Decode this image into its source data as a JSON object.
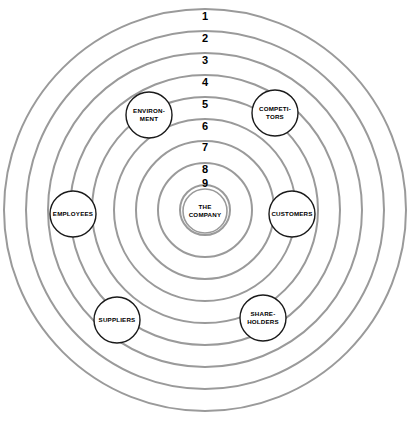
{
  "diagram": {
    "type": "concentric-circles-stakeholder-map",
    "background_color": "#ffffff",
    "ring_stroke_color": "#9a9a9a",
    "node_stroke_color": "#1a1a1a",
    "node_fill_color": "#ffffff",
    "center": {
      "cx": 205,
      "cy": 210
    },
    "rings": [
      {
        "label": "1",
        "radius": 201,
        "label_x": 205,
        "label_y": 17
      },
      {
        "label": "2",
        "radius": 179,
        "label_x": 205,
        "label_y": 39
      },
      {
        "label": "3",
        "radius": 157,
        "label_x": 205,
        "label_y": 61
      },
      {
        "label": "4",
        "radius": 135,
        "label_x": 205,
        "label_y": 83
      },
      {
        "label": "5",
        "radius": 113,
        "label_x": 205,
        "label_y": 105
      },
      {
        "label": "6",
        "radius": 91,
        "label_x": 205,
        "label_y": 127
      },
      {
        "label": "7",
        "radius": 69,
        "label_x": 205,
        "label_y": 148
      },
      {
        "label": "8",
        "radius": 47,
        "label_x": 205,
        "label_y": 170
      },
      {
        "label": "9",
        "radius": 25,
        "label_x": 205,
        "label_y": 184
      }
    ],
    "center_node": {
      "id": "the-company",
      "cx": 205,
      "cy": 211,
      "radius": 22,
      "lines": [
        "THE",
        "COMPANY"
      ]
    },
    "stakeholders": [
      {
        "id": "environment",
        "cx": 149,
        "cy": 115,
        "radius": 23,
        "lines": [
          "ENVIRON-",
          "MENT"
        ]
      },
      {
        "id": "competitors",
        "cx": 275,
        "cy": 113,
        "radius": 23,
        "lines": [
          "COMPETI-",
          "TORS"
        ]
      },
      {
        "id": "employees",
        "cx": 73,
        "cy": 214,
        "radius": 23,
        "lines": [
          "EMPLOYEES"
        ]
      },
      {
        "id": "customers",
        "cx": 292,
        "cy": 214,
        "radius": 23,
        "lines": [
          "CUSTOMERS"
        ]
      },
      {
        "id": "suppliers",
        "cx": 117,
        "cy": 320,
        "radius": 23,
        "lines": [
          "SUPPLIERS"
        ]
      },
      {
        "id": "shareholders",
        "cx": 263,
        "cy": 318,
        "radius": 23,
        "lines": [
          "SHARE-",
          "HOLDERS"
        ]
      }
    ]
  }
}
